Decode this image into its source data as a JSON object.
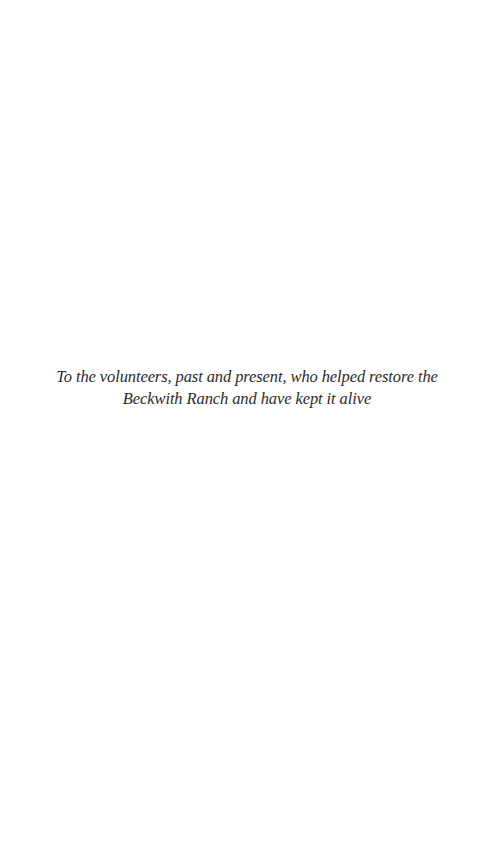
{
  "page": {
    "background_color": "#ffffff",
    "text_color": "#2b2b2b"
  },
  "dedication": {
    "text": "To the volunteers, past and present, who helped restore the Beckwith Ranch and have kept it alive"
  }
}
